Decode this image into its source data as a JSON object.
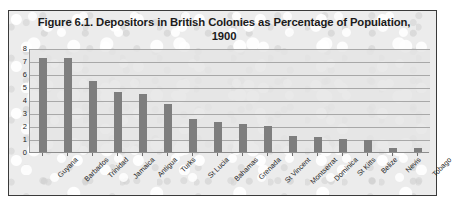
{
  "chart_data": {
    "type": "bar",
    "title": "Figure 6.1. Depositors in British Colonies as Percentage of Population, 1900",
    "title_line1": "Figure 6.1. Depositors in British Colonies as Percentage of Population,",
    "title_line2": "1900",
    "xlabel": "",
    "ylabel": "",
    "ylim": [
      0,
      8
    ],
    "grid": true,
    "legend": false,
    "bar_color": "#7e7e7e",
    "plot_background": "#e4e4e4",
    "categories": [
      "Guyana",
      "Barbados",
      "Trinidad",
      "Jamaica",
      "Antigua",
      "Turks",
      "St Lucia",
      "Bahamas",
      "Grenada",
      "St Vincent",
      "Montserrat",
      "Dominica",
      "St Kitts",
      "Belize",
      "Nevis",
      "Tobago"
    ],
    "values": [
      7.3,
      7.3,
      5.5,
      4.7,
      4.5,
      3.8,
      2.6,
      2.4,
      2.2,
      2.1,
      1.3,
      1.2,
      1.1,
      1.0,
      0.35,
      0.35
    ],
    "yticks": [
      8,
      7,
      6,
      5,
      4,
      3,
      2,
      1,
      0
    ],
    "ytick_labels": [
      "8",
      "7",
      "6",
      "5",
      "4",
      "3",
      "2",
      "1",
      "0"
    ]
  }
}
